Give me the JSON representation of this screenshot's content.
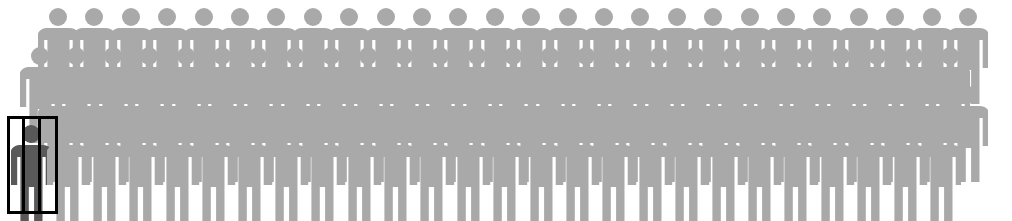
{
  "graphic": {
    "type": "pictogram",
    "title": "",
    "icon_name": "person-icon",
    "description": "Crowd of grey person pictograms with one dark figure highlighted behind prison bars",
    "canvas": {
      "width": 1012,
      "height": 221
    },
    "colors": {
      "background": "#ffffff",
      "crowd_figure": "#a9a9a9",
      "highlighted_figure": "#595959",
      "cell_frame": "#000000"
    }
  },
  "chart_data": {
    "type": "pictogram",
    "title": "",
    "unit_label": "person",
    "rows": [
      {
        "row": 1,
        "count": 26,
        "x_start": 58,
        "x_step": 36.4,
        "y_top": 4
      },
      {
        "row": 2,
        "count": 26,
        "x_start": 40,
        "x_step": 36.4,
        "y_top": 43
      },
      {
        "row": 3,
        "count": 26,
        "x_start": 58,
        "x_step": 36.4,
        "y_top": 82
      },
      {
        "row": 4,
        "count": 26,
        "x_start": 31,
        "x_step": 36.4,
        "y_top": 121
      }
    ],
    "total_figures": 104,
    "highlighted_count": 1,
    "highlighted": {
      "row": 4,
      "index": 0,
      "label": "incarcerated-figure",
      "fill": "#595959"
    },
    "legend": [],
    "annotations": []
  },
  "highlight_cell": {
    "name": "prison-cell-highlight",
    "x": 7,
    "y": 116,
    "width": 51,
    "height": 98,
    "border_width": 3,
    "bar_count": 2,
    "bar_width": 3,
    "bar_offsets": [
      15,
      31
    ]
  },
  "figure_geometry": {
    "width": 40,
    "height": 100,
    "head_cy": 13,
    "head_r": 9,
    "body_top": 24,
    "shoulder_width": 34,
    "leg_gap": 5
  }
}
